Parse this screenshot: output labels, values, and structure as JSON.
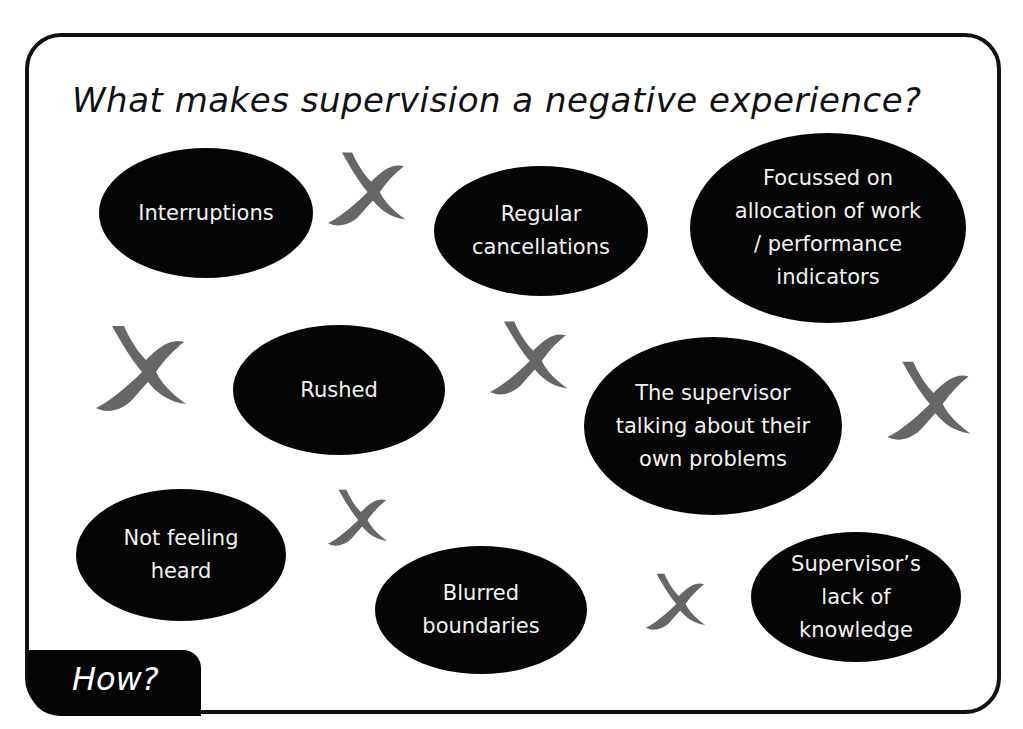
{
  "title": "What makes supervision a negative experience?",
  "bubbles": [
    {
      "id": "interruptions",
      "text": "Interruptions",
      "cx": 206,
      "cy": 213,
      "w": 214,
      "h": 130
    },
    {
      "id": "regular-cancellations",
      "text": "Regular\ncancellations",
      "cx": 541,
      "cy": 231,
      "w": 214,
      "h": 130
    },
    {
      "id": "focussed-on-allocation",
      "text": "Focussed on\nallocation of work\n/ performance\nindicators",
      "cx": 828,
      "cy": 228,
      "w": 276,
      "h": 190
    },
    {
      "id": "rushed",
      "text": "Rushed",
      "cx": 339,
      "cy": 390,
      "w": 212,
      "h": 130
    },
    {
      "id": "supervisor-own-problems",
      "text": "The supervisor\ntalking about their\nown problems",
      "cx": 713,
      "cy": 426,
      "w": 258,
      "h": 178
    },
    {
      "id": "not-feeling-heard",
      "text": "Not feeling\nheard",
      "cx": 181,
      "cy": 555,
      "w": 210,
      "h": 132
    },
    {
      "id": "blurred-boundaries",
      "text": "Blurred\nboundaries",
      "cx": 481,
      "cy": 610,
      "w": 212,
      "h": 128
    },
    {
      "id": "supervisor-lack-of-knowledge",
      "text": "Supervisor’s\nlack of\nknowledge",
      "cx": 856,
      "cy": 597,
      "w": 210,
      "h": 130
    }
  ],
  "crosses": [
    {
      "cx": 366,
      "cy": 192,
      "size": 86
    },
    {
      "cx": 140,
      "cy": 372,
      "size": 100
    },
    {
      "cx": 528,
      "cy": 361,
      "size": 86
    },
    {
      "cx": 928,
      "cy": 404,
      "size": 92
    },
    {
      "cx": 357,
      "cy": 520,
      "size": 66
    },
    {
      "cx": 675,
      "cy": 604,
      "size": 66
    }
  ],
  "colors": {
    "cross": "#666666",
    "bubble": "#050505",
    "bubble_text": "#f2f2f2",
    "frame": "#111111"
  },
  "footer_tab": {
    "label": "How?"
  }
}
